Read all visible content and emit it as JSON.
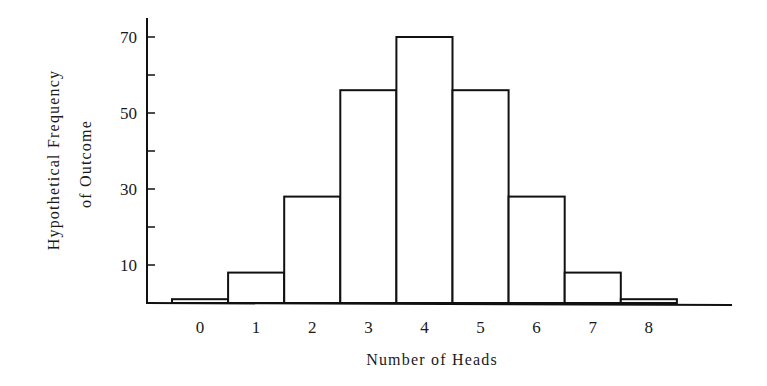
{
  "chart_data": {
    "type": "bar",
    "subtype": "histogram",
    "title": "",
    "xlabel": "Number of Heads",
    "ylabel": "Hypothetical Frequency of Outcome",
    "ylabel_lines": [
      "Hypothetical Frequency",
      "of Outcome"
    ],
    "categories": [
      "0",
      "1",
      "2",
      "3",
      "4",
      "5",
      "6",
      "7",
      "8"
    ],
    "values": [
      1,
      8,
      28,
      56,
      70,
      56,
      28,
      8,
      1
    ],
    "ylim": [
      0,
      75
    ],
    "yticks_labeled": [
      10,
      30,
      50,
      70
    ],
    "yticks_minor": [
      20,
      40,
      60
    ],
    "grid": false,
    "legend": null,
    "bar_fill": "#ffffff",
    "bar_edge": "#111111"
  }
}
